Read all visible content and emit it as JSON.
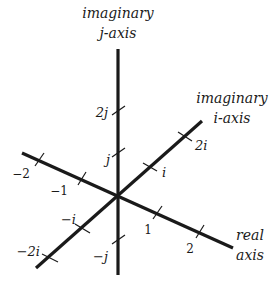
{
  "diagram": {
    "axes": {
      "j_axis": {
        "title_line1": "imaginary",
        "title_line2": "j-axis"
      },
      "i_axis": {
        "title_line1": "imaginary",
        "title_line2": "i-axis"
      },
      "real_axis": {
        "title_line1": "real",
        "title_line2": "axis"
      }
    },
    "tick_labels": {
      "j_axis": {
        "pos2": "2j",
        "pos1": "j",
        "neg1": "−j"
      },
      "i_axis": {
        "pos2": "2i",
        "pos1": "i",
        "neg1": "−i",
        "neg2": "−2i"
      },
      "real_axis": {
        "pos1": "1",
        "pos2": "2",
        "neg1": "−1",
        "neg2": "−2"
      }
    },
    "colors": {
      "ink": "#1a1a1a",
      "background": "#ffffff"
    }
  }
}
